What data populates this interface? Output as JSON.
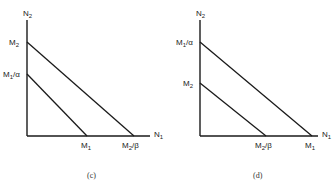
{
  "panels": [
    {
      "caption": "(c)",
      "y_axis_label": "N",
      "y_axis_sub": "2",
      "x_axis_label": "N",
      "x_axis_sub": "1",
      "y_intercepts": [
        {
          "main": "M",
          "sub": "2",
          "rest": ""
        },
        {
          "main": "M",
          "sub": "1",
          "rest": "/α"
        }
      ],
      "x_intercepts": [
        {
          "main": "M",
          "sub": "1",
          "rest": ""
        },
        {
          "main": "M",
          "sub": "2",
          "rest": "/β"
        }
      ],
      "lines": [
        {
          "from": "M2",
          "to": "M2/β"
        },
        {
          "from": "M1/α",
          "to": "M1"
        }
      ]
    },
    {
      "caption": "(d)",
      "y_axis_label": "N",
      "y_axis_sub": "2",
      "x_axis_label": "N",
      "x_axis_sub": "1",
      "y_intercepts": [
        {
          "main": "M",
          "sub": "1",
          "rest": "/α"
        },
        {
          "main": "M",
          "sub": "2",
          "rest": ""
        }
      ],
      "x_intercepts": [
        {
          "main": "M",
          "sub": "2",
          "rest": "/β"
        },
        {
          "main": "M",
          "sub": "1",
          "rest": ""
        }
      ],
      "lines": [
        {
          "from": "M1/α",
          "to": "M1"
        },
        {
          "from": "M2",
          "to": "M2/β"
        }
      ]
    }
  ]
}
